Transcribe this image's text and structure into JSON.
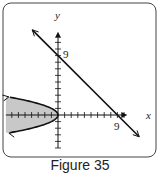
{
  "figure": {
    "caption": "Figure 35",
    "x_axis_label": "x",
    "y_axis_label": "y",
    "x_tick_label": "9",
    "y_tick_label": "9",
    "colors": {
      "stroke": "#111111",
      "shade": "#c8c8c8",
      "frame": "#444444"
    }
  },
  "chart_data": {
    "type": "graph",
    "title": "Figure 35",
    "xlabel": "x",
    "ylabel": "y",
    "xlim": [
      -8.5,
      10.5
    ],
    "ylim": [
      -5,
      12
    ],
    "tick_step": 1,
    "labeled_ticks": {
      "x": [
        9
      ],
      "y": [
        9
      ]
    },
    "curves": [
      {
        "name": "line",
        "equation": "x + y = 9",
        "points": [
          [
            -4,
            13
          ],
          [
            12,
            -3
          ]
        ],
        "arrows": "both"
      },
      {
        "name": "parabola",
        "equation": "x = -y^2",
        "y_range": [
          -2.7,
          2.7
        ],
        "arrows": "both",
        "shaded": "inside (x <= -y^2)"
      }
    ]
  }
}
